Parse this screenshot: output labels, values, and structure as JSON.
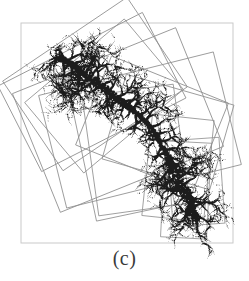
{
  "figure": {
    "caption": "(c)",
    "background_color": "#ffffff",
    "frame": {
      "name": "plot-frame",
      "x": 21,
      "y": 23,
      "width": 212,
      "height": 220,
      "stroke": "#c9c9c9",
      "stroke_width": 1
    },
    "cluster": {
      "name": "dla-fractal-cluster",
      "color": "#1c1c1c",
      "description": "diffusion-limited aggregation dendritic cluster",
      "seed_points": [
        [
          62,
          55
        ],
        [
          200,
          215
        ]
      ],
      "trunk": [
        [
          60,
          57
        ],
        [
          70,
          63
        ],
        [
          80,
          70
        ],
        [
          90,
          78
        ],
        [
          100,
          86
        ],
        [
          110,
          94
        ],
        [
          120,
          101
        ],
        [
          130,
          108
        ],
        [
          140,
          116
        ],
        [
          150,
          126
        ],
        [
          158,
          138
        ],
        [
          164,
          150
        ],
        [
          170,
          162
        ],
        [
          176,
          174
        ],
        [
          182,
          186
        ],
        [
          188,
          198
        ],
        [
          193,
          210
        ],
        [
          197,
          220
        ]
      ]
    },
    "bounding_boxes": {
      "name": "rotated-bounding-boxes",
      "stroke": "#8f8f8f",
      "stroke_width": 0.8,
      "boxes": [
        {
          "cx": 95,
          "cy": 84,
          "w": 150,
          "h": 108,
          "angle": -34
        },
        {
          "cx": 92,
          "cy": 92,
          "w": 162,
          "h": 96,
          "angle": -27
        },
        {
          "cx": 104,
          "cy": 96,
          "w": 130,
          "h": 92,
          "angle": -40
        },
        {
          "cx": 118,
          "cy": 120,
          "w": 176,
          "h": 128,
          "angle": -22
        },
        {
          "cx": 140,
          "cy": 130,
          "w": 180,
          "h": 116,
          "angle": -14
        },
        {
          "cx": 152,
          "cy": 124,
          "w": 126,
          "h": 96,
          "angle": 22
        },
        {
          "cx": 168,
          "cy": 132,
          "w": 112,
          "h": 88,
          "angle": 16
        },
        {
          "cx": 178,
          "cy": 168,
          "w": 62,
          "h": 102,
          "angle": 6
        },
        {
          "cx": 186,
          "cy": 190,
          "w": 46,
          "h": 96,
          "angle": 3
        },
        {
          "cx": 196,
          "cy": 182,
          "w": 52,
          "h": 86,
          "angle": -4
        },
        {
          "cx": 136,
          "cy": 150,
          "w": 92,
          "h": 120,
          "angle": -8
        },
        {
          "cx": 124,
          "cy": 158,
          "w": 80,
          "h": 112,
          "angle": -12
        }
      ]
    }
  }
}
